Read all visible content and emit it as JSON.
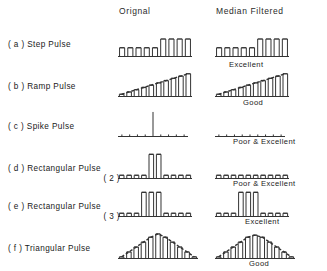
{
  "figure": {
    "title_columns": {
      "original": "Orignal",
      "median_filtered": "Median Filtered"
    }
  },
  "rows": [
    {
      "id": "step-pulse",
      "label": "( a ) Step Pulse",
      "sublabel": "",
      "quality": "Excellent",
      "original": {
        "type": "bar",
        "categories": [
          "1",
          "2",
          "3",
          "4",
          "5",
          "6",
          "7",
          "8",
          "9"
        ],
        "values": [
          1,
          1,
          1,
          1,
          1,
          2,
          2,
          2,
          2
        ],
        "ylim": [
          0,
          2.4
        ]
      },
      "filtered": {
        "type": "bar",
        "categories": [
          "1",
          "2",
          "3",
          "4",
          "5",
          "6",
          "7",
          "8",
          "9"
        ],
        "values": [
          1,
          1,
          1,
          1,
          1,
          2,
          2,
          2,
          2
        ],
        "ylim": [
          0,
          2.4
        ]
      }
    },
    {
      "id": "ramp-pulse",
      "label": "( b ) Ramp Pulse",
      "sublabel": "",
      "quality": "Good",
      "original": {
        "type": "bar",
        "categories": [
          "1",
          "2",
          "3",
          "4",
          "5",
          "6",
          "7",
          "8",
          "9",
          "10"
        ],
        "values": [
          0.3,
          0.6,
          0.9,
          1.2,
          1.5,
          1.8,
          2.1,
          2.4,
          2.7,
          3.0
        ],
        "ylim": [
          0,
          3.3
        ]
      },
      "filtered": {
        "type": "bar",
        "categories": [
          "1",
          "2",
          "3",
          "4",
          "5",
          "6",
          "7",
          "8",
          "9",
          "10"
        ],
        "values": [
          0.3,
          0.6,
          0.9,
          1.2,
          1.5,
          1.8,
          2.1,
          2.4,
          2.7,
          3.0
        ],
        "ylim": [
          0,
          3.3
        ]
      }
    },
    {
      "id": "spike-pulse",
      "label": "( c ) Spike Pulse",
      "sublabel": "",
      "quality": "Poor & Excellent",
      "original": {
        "type": "bar",
        "categories": [
          "1",
          "2",
          "3",
          "4",
          "5",
          "6",
          "7",
          "8",
          "9"
        ],
        "values": [
          0.25,
          0.25,
          0.25,
          0.25,
          3.0,
          0.25,
          0.25,
          0.25,
          0.25
        ],
        "ylim": [
          0,
          3.3
        ]
      },
      "filtered": {
        "type": "bar",
        "categories": [
          "1",
          "2",
          "3",
          "4",
          "5",
          "6",
          "7",
          "8",
          "9"
        ],
        "values": [
          0.25,
          0.25,
          0.25,
          0.25,
          0.25,
          0.25,
          0.25,
          0.25,
          0.25
        ],
        "ylim": [
          0,
          3.3
        ]
      }
    },
    {
      "id": "rectangular-pulse-2",
      "label": "( d ) Rectangular Pulse",
      "sublabel": "( 2 )",
      "quality": "Poor & Excellent",
      "original": {
        "type": "bar",
        "categories": [
          "1",
          "2",
          "3",
          "4",
          "5",
          "6",
          "7",
          "8",
          "9",
          "10"
        ],
        "values": [
          0.35,
          0.35,
          0.35,
          0.35,
          2.6,
          2.6,
          0.35,
          0.35,
          0.35,
          0.35
        ],
        "ylim": [
          0,
          2.9
        ]
      },
      "filtered": {
        "type": "bar",
        "categories": [
          "1",
          "2",
          "3",
          "4",
          "5",
          "6",
          "7",
          "8",
          "9",
          "10"
        ],
        "values": [
          0.35,
          0.35,
          0.35,
          0.35,
          0.35,
          0.35,
          0.35,
          0.35,
          0.35,
          0.35
        ],
        "ylim": [
          0,
          2.9
        ]
      }
    },
    {
      "id": "rectangular-pulse-3",
      "label": "( e ) Rectangular Pulse",
      "sublabel": "( 3 )",
      "quality": "Excellent",
      "original": {
        "type": "bar",
        "categories": [
          "1",
          "2",
          "3",
          "4",
          "5",
          "6",
          "7",
          "8",
          "9",
          "10"
        ],
        "values": [
          0.35,
          0.35,
          0.35,
          2.6,
          2.6,
          2.6,
          0.35,
          0.35,
          0.35,
          0.35
        ],
        "ylim": [
          0,
          2.9
        ]
      },
      "filtered": {
        "type": "bar",
        "categories": [
          "1",
          "2",
          "3",
          "4",
          "5",
          "6",
          "7",
          "8",
          "9",
          "10"
        ],
        "values": [
          0.35,
          0.35,
          0.35,
          2.6,
          2.6,
          2.6,
          0.35,
          0.35,
          0.35,
          0.35
        ],
        "ylim": [
          0,
          2.9
        ]
      }
    },
    {
      "id": "triangular-pulse",
      "label": "( f ) Triangular Pulse",
      "sublabel": "",
      "quality": "Good",
      "original": {
        "type": "bar",
        "categories": [
          "1",
          "2",
          "3",
          "4",
          "5",
          "6",
          "7",
          "8",
          "9",
          "10",
          "11"
        ],
        "values": [
          0.2,
          0.8,
          1.4,
          2.0,
          2.6,
          3.0,
          2.6,
          2.0,
          1.4,
          0.8,
          0.2
        ],
        "ylim": [
          0,
          3.3
        ]
      },
      "filtered": {
        "type": "bar",
        "categories": [
          "1",
          "2",
          "3",
          "4",
          "5",
          "6",
          "7",
          "8",
          "9",
          "10",
          "11"
        ],
        "values": [
          0.2,
          0.8,
          1.4,
          2.0,
          2.6,
          2.85,
          2.6,
          2.0,
          1.4,
          0.8,
          0.2
        ],
        "ylim": [
          0,
          3.3
        ]
      }
    }
  ],
  "chart_data": {
    "type": "bar",
    "xlabel": "",
    "ylabel": "",
    "grid": false,
    "legend": "none",
    "columns": [
      "Orignal",
      "Median Filtered"
    ],
    "series": [
      {
        "name": "( a ) Step Pulse - Orignal",
        "values": [
          1,
          1,
          1,
          1,
          1,
          2,
          2,
          2,
          2
        ]
      },
      {
        "name": "( a ) Step Pulse - Median Filtered",
        "values": [
          1,
          1,
          1,
          1,
          1,
          2,
          2,
          2,
          2
        ]
      },
      {
        "name": "( b ) Ramp Pulse - Orignal",
        "values": [
          0.3,
          0.6,
          0.9,
          1.2,
          1.5,
          1.8,
          2.1,
          2.4,
          2.7,
          3.0
        ]
      },
      {
        "name": "( b ) Ramp Pulse - Median Filtered",
        "values": [
          0.3,
          0.6,
          0.9,
          1.2,
          1.5,
          1.8,
          2.1,
          2.4,
          2.7,
          3.0
        ]
      },
      {
        "name": "( c ) Spike Pulse - Orignal",
        "values": [
          0.25,
          0.25,
          0.25,
          0.25,
          3.0,
          0.25,
          0.25,
          0.25,
          0.25
        ]
      },
      {
        "name": "( c ) Spike Pulse - Median Filtered",
        "values": [
          0.25,
          0.25,
          0.25,
          0.25,
          0.25,
          0.25,
          0.25,
          0.25,
          0.25
        ]
      },
      {
        "name": "( d ) Rectangular Pulse ( 2 ) - Orignal",
        "values": [
          0.35,
          0.35,
          0.35,
          0.35,
          2.6,
          2.6,
          0.35,
          0.35,
          0.35,
          0.35
        ]
      },
      {
        "name": "( d ) Rectangular Pulse ( 2 ) - Median Filtered",
        "values": [
          0.35,
          0.35,
          0.35,
          0.35,
          0.35,
          0.35,
          0.35,
          0.35,
          0.35,
          0.35
        ]
      },
      {
        "name": "( e ) Rectangular Pulse ( 3 ) - Orignal",
        "values": [
          0.35,
          0.35,
          0.35,
          2.6,
          2.6,
          2.6,
          0.35,
          0.35,
          0.35,
          0.35
        ]
      },
      {
        "name": "( e ) Rectangular Pulse ( 3 ) - Median Filtered",
        "values": [
          0.35,
          0.35,
          0.35,
          2.6,
          2.6,
          2.6,
          0.35,
          0.35,
          0.35,
          0.35
        ]
      },
      {
        "name": "( f ) Triangular Pulse - Orignal",
        "values": [
          0.2,
          0.8,
          1.4,
          2.0,
          2.6,
          3.0,
          2.6,
          2.0,
          1.4,
          0.8,
          0.2
        ]
      },
      {
        "name": "( f ) Triangular Pulse - Median Filtered",
        "values": [
          0.2,
          0.8,
          1.4,
          2.0,
          2.6,
          2.85,
          2.6,
          2.0,
          1.4,
          0.8,
          0.2
        ]
      }
    ],
    "annotations": [
      "Excellent",
      "Good",
      "Poor & Excellent",
      "Poor & Excellent",
      "Excellent",
      "Good"
    ]
  }
}
